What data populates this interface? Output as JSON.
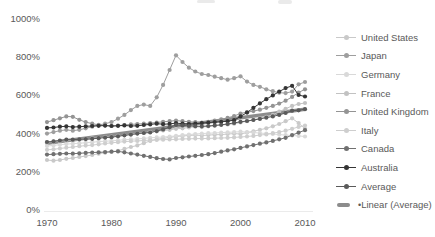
{
  "axes": {
    "y_tick_labels": [
      "0%",
      "200%",
      "400%",
      "600%",
      "800%",
      "1000%"
    ],
    "y_tick_values": [
      0,
      200,
      400,
      600,
      800,
      1000
    ],
    "x_tick_labels": [
      "1970",
      "1980",
      "1990",
      "2000",
      "2010"
    ],
    "x_tick_values": [
      1970,
      1980,
      1990,
      2000,
      2010
    ],
    "text_color": "#595959"
  },
  "legend": {
    "trend_bullet": "•"
  },
  "chart_data": {
    "type": "line",
    "title": "",
    "xlabel": "",
    "ylabel": "",
    "xlim": [
      1970,
      2010
    ],
    "ylim": [
      0,
      1000
    ],
    "grid": false,
    "legend_position": "right",
    "x_start": 1970,
    "x_step": 1,
    "series": [
      {
        "name": "United States",
        "color": "#c9c9c9",
        "values": [
          262,
          258,
          262,
          268,
          272,
          278,
          282,
          288,
          295,
          300,
          305,
          310,
          320,
          330,
          338,
          350,
          362,
          370,
          375,
          380,
          385,
          388,
          390,
          392,
          390,
          392,
          394,
          395,
          398,
          400,
          398,
          405,
          412,
          420,
          428,
          438,
          450,
          465,
          480,
          455,
          425
        ]
      },
      {
        "name": "Japan",
        "color": "#9e9e9e",
        "values": [
          400,
          408,
          415,
          420,
          415,
          420,
          428,
          436,
          445,
          452,
          460,
          478,
          498,
          523,
          545,
          552,
          545,
          590,
          655,
          733,
          810,
          775,
          745,
          725,
          712,
          707,
          698,
          690,
          682,
          690,
          700,
          672,
          655,
          645,
          632,
          622,
          614,
          612,
          620,
          658,
          670
        ]
      },
      {
        "name": "Germany",
        "color": "#d9d9d9",
        "values": [
          335,
          338,
          342,
          345,
          347,
          350,
          352,
          355,
          358,
          360,
          362,
          365,
          368,
          370,
          372,
          375,
          378,
          380,
          382,
          385,
          388,
          392,
          395,
          398,
          400,
          402,
          403,
          405,
          407,
          408,
          410,
          408,
          405,
          403,
          400,
          398,
          395,
          392,
          390,
          388,
          385
        ]
      },
      {
        "name": "France",
        "color": "#c2c2c2",
        "values": [
          355,
          358,
          361,
          364,
          366,
          369,
          372,
          375,
          378,
          381,
          384,
          388,
          392,
          396,
          400,
          404,
          408,
          412,
          416,
          420,
          425,
          428,
          432,
          436,
          434,
          438,
          441,
          445,
          448,
          452,
          458,
          465,
          472,
          480,
          488,
          498,
          515,
          530,
          545,
          555,
          560
        ]
      },
      {
        "name": "United Kingdom",
        "color": "#949494",
        "values": [
          460,
          470,
          480,
          490,
          488,
          472,
          460,
          452,
          446,
          442,
          440,
          442,
          445,
          448,
          450,
          452,
          455,
          458,
          462,
          465,
          468,
          465,
          462,
          460,
          458,
          462,
          468,
          475,
          482,
          492,
          505,
          512,
          518,
          525,
          535,
          545,
          557,
          572,
          592,
          615,
          632
        ]
      },
      {
        "name": "Italy",
        "color": "#cecece",
        "values": [
          315,
          318,
          322,
          326,
          330,
          334,
          337,
          340,
          344,
          348,
          352,
          355,
          358,
          360,
          362,
          364,
          366,
          367,
          368,
          369,
          370,
          372,
          373,
          374,
          374,
          375,
          376,
          377,
          378,
          380,
          382,
          385,
          388,
          392,
          396,
          402,
          408,
          415,
          425,
          435,
          442
        ]
      },
      {
        "name": "Canada",
        "color": "#707070",
        "values": [
          290,
          292,
          294,
          296,
          295,
          297,
          299,
          301,
          302,
          303,
          305,
          307,
          302,
          296,
          290,
          284,
          278,
          271,
          267,
          265,
          272,
          276,
          280,
          284,
          288,
          292,
          298,
          305,
          312,
          318,
          325,
          333,
          340,
          347,
          354,
          362,
          370,
          378,
          392,
          405,
          418
        ]
      },
      {
        "name": "Australia",
        "color": "#353535",
        "values": [
          430,
          432,
          436,
          438,
          434,
          436,
          438,
          440,
          441,
          442,
          440,
          441,
          443,
          440,
          441,
          445,
          448,
          452,
          449,
          451,
          455,
          452,
          450,
          452,
          455,
          458,
          460,
          462,
          465,
          470,
          490,
          510,
          535,
          558,
          580,
          600,
          620,
          638,
          650,
          602,
          594
        ]
      },
      {
        "name": "Average",
        "color": "#5a5a5a",
        "values": [
          356,
          359,
          364,
          368,
          368,
          370,
          371,
          373,
          376,
          379,
          381,
          386,
          391,
          395,
          400,
          403,
          406,
          413,
          422,
          433,
          445,
          443,
          440,
          439,
          438,
          440,
          443,
          446,
          450,
          456,
          462,
          466,
          471,
          477,
          483,
          490,
          498,
          508,
          520,
          522,
          528
        ]
      }
    ],
    "trendline": {
      "name": "Linear (Average)",
      "color": "#8c8c8c",
      "start_value": 350,
      "end_value": 528,
      "stroke_width": 3.5
    }
  }
}
